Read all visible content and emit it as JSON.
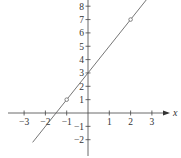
{
  "chart_data": {
    "type": "line",
    "title": "",
    "xlabel": "x",
    "ylabel": "",
    "xlim": [
      -3.9,
      4.1
    ],
    "ylim": [
      -3.2,
      8.5
    ],
    "grid": false,
    "x_ticks": [
      -3,
      -2,
      -1,
      1,
      2,
      3
    ],
    "y_ticks": [
      -2,
      -1,
      1,
      2,
      3,
      4,
      5,
      6,
      7,
      8
    ],
    "x_tick_labels": [
      "−3",
      "−2",
      "−1",
      "1",
      "2",
      "3"
    ],
    "y_tick_labels": [
      "−2",
      "−1",
      "1",
      "2",
      "3",
      "4",
      "5",
      "6",
      "7",
      "8"
    ],
    "series": [
      {
        "name": "y = 2x + 3",
        "equation": "y = 2x + 3",
        "slope": 2,
        "intercept": 3,
        "x": [
          -2.6,
          2.75
        ],
        "values": [
          -2.2,
          8.5
        ],
        "color": "#555555"
      }
    ],
    "marked_points": [
      {
        "x": -1,
        "y": 1,
        "style": "open-circle"
      },
      {
        "x": 2,
        "y": 7,
        "style": "open-circle"
      }
    ],
    "colors": {
      "axis": "#444444",
      "line": "#666666",
      "text": "#333333"
    }
  }
}
